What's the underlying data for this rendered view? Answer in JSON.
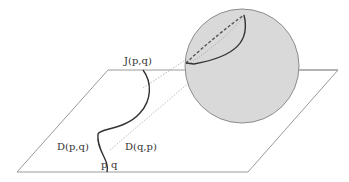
{
  "diagram": {
    "labels": {
      "j": "J(p,q)",
      "d_pq": "D(p,q)",
      "d_qp": "D(q,p)",
      "p": "p",
      "q": "q"
    },
    "colors": {
      "background": "#ffffff",
      "plane_stroke": "#9a9a9a",
      "sphere_fill": "#d9d9d9",
      "sphere_stroke": "#8c8c8c",
      "curve": "#333333",
      "dashed": "#555555",
      "dotted": "#aaaaaa",
      "text": "#333333"
    }
  }
}
